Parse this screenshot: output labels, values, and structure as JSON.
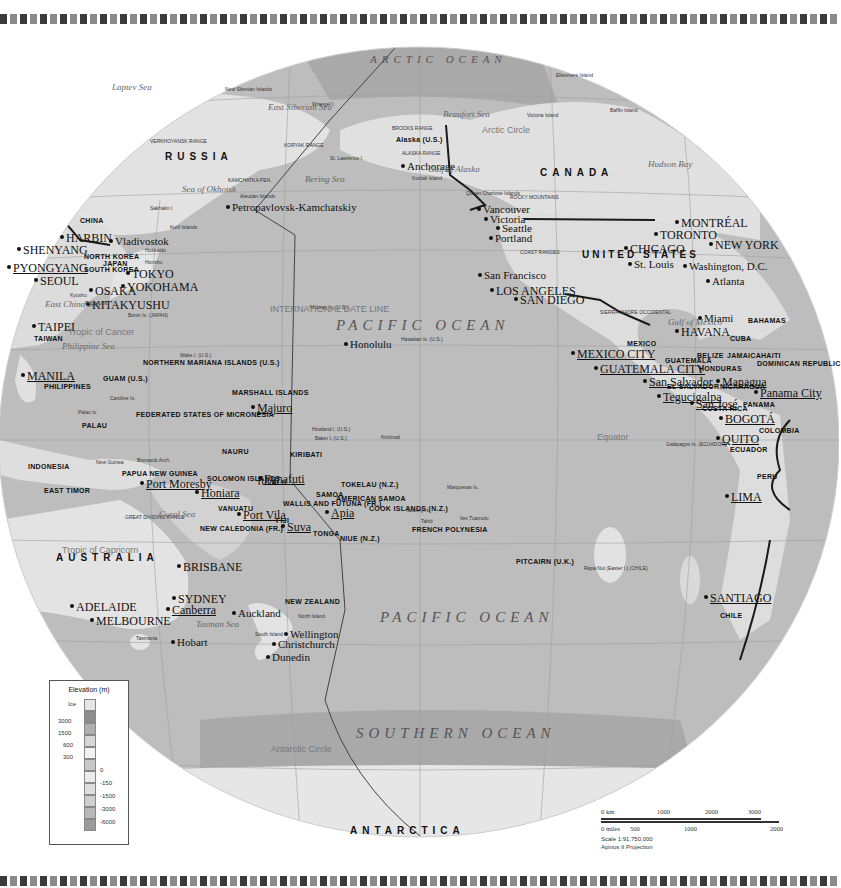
{
  "map": {
    "title": "Pacific Ocean (Azimuthal projection)",
    "oceans": [
      {
        "name": "ARCTIC OCEAN",
        "x": 370,
        "y": 54
      },
      {
        "name": "PACIFIC OCEAN",
        "x": 336,
        "y": 320
      },
      {
        "name": "PACIFIC OCEAN",
        "x": 380,
        "y": 612
      },
      {
        "name": "SOUTHERN OCEAN",
        "x": 356,
        "y": 728
      }
    ],
    "regions": [
      {
        "name": "RUSSIA",
        "x": 165,
        "y": 156
      },
      {
        "name": "CANADA",
        "x": 540,
        "y": 172
      },
      {
        "name": "UNITED STATES",
        "x": 582,
        "y": 254
      },
      {
        "name": "AUSTRALIA",
        "x": 56,
        "y": 557
      },
      {
        "name": "ANTARCTICA",
        "x": 350,
        "y": 830
      }
    ],
    "countries": [
      {
        "name": "CHINA",
        "x": 80,
        "y": 222
      },
      {
        "name": "NORTH KOREA",
        "x": 84,
        "y": 258
      },
      {
        "name": "SOUTH KOREA",
        "x": 84,
        "y": 271
      },
      {
        "name": "JAPAN",
        "x": 103,
        "y": 265
      },
      {
        "name": "TAIWAN",
        "x": 34,
        "y": 340
      },
      {
        "name": "PHILIPPINES",
        "x": 44,
        "y": 388
      },
      {
        "name": "NORTHERN MARIANA ISLANDS (U.S.)",
        "x": 143,
        "y": 364
      },
      {
        "name": "GUAM (U.S.)",
        "x": 103,
        "y": 380
      },
      {
        "name": "PALAU",
        "x": 82,
        "y": 427
      },
      {
        "name": "FEDERATED STATES OF MICRONESIA",
        "x": 136,
        "y": 416
      },
      {
        "name": "MARSHALL ISLANDS",
        "x": 232,
        "y": 394
      },
      {
        "name": "NAURU",
        "x": 222,
        "y": 453
      },
      {
        "name": "KIRIBATI",
        "x": 290,
        "y": 456
      },
      {
        "name": "INDONESIA",
        "x": 28,
        "y": 468
      },
      {
        "name": "EAST TIMOR",
        "x": 44,
        "y": 492
      },
      {
        "name": "PAPUA NEW GUINEA",
        "x": 122,
        "y": 475
      },
      {
        "name": "SOLOMON ISLANDS",
        "x": 207,
        "y": 480
      },
      {
        "name": "TUVALU",
        "x": 257,
        "y": 484
      },
      {
        "name": "VANUATU",
        "x": 218,
        "y": 510
      },
      {
        "name": "NEW CALEDONIA (FR.)",
        "x": 200,
        "y": 530
      },
      {
        "name": "FIJI",
        "x": 276,
        "y": 522
      },
      {
        "name": "WALLIS AND FUTUNA (FR.)",
        "x": 283,
        "y": 505
      },
      {
        "name": "SAMOA",
        "x": 316,
        "y": 496
      },
      {
        "name": "AMERICAN SAMOA",
        "x": 336,
        "y": 500
      },
      {
        "name": "TONGA",
        "x": 313,
        "y": 535
      },
      {
        "name": "NIUE (N.Z.)",
        "x": 340,
        "y": 540
      },
      {
        "name": "TOKELAU (N.Z.)",
        "x": 341,
        "y": 486
      },
      {
        "name": "COOK ISLANDS (N.Z.)",
        "x": 369,
        "y": 510
      },
      {
        "name": "FRENCH POLYNESIA",
        "x": 412,
        "y": 531
      },
      {
        "name": "PITCAIRN (U.K.)",
        "x": 516,
        "y": 563
      },
      {
        "name": "NEW ZEALAND",
        "x": 285,
        "y": 603
      },
      {
        "name": "MEXICO",
        "x": 627,
        "y": 345
      },
      {
        "name": "BELIZE",
        "x": 697,
        "y": 357
      },
      {
        "name": "GUATEMALA",
        "x": 665,
        "y": 362
      },
      {
        "name": "HONDURAS",
        "x": 699,
        "y": 370
      },
      {
        "name": "EL SALVADOR",
        "x": 667,
        "y": 388
      },
      {
        "name": "NICARAGUA",
        "x": 720,
        "y": 388
      },
      {
        "name": "COSTA RICA",
        "x": 702,
        "y": 410
      },
      {
        "name": "PANAMA",
        "x": 743,
        "y": 406
      },
      {
        "name": "JAMAICA",
        "x": 727,
        "y": 357
      },
      {
        "name": "HAITI",
        "x": 761,
        "y": 357
      },
      {
        "name": "DOMINICAN REPUBLIC",
        "x": 757,
        "y": 365
      },
      {
        "name": "BAHAMAS",
        "x": 748,
        "y": 322
      },
      {
        "name": "CUBA",
        "x": 730,
        "y": 340
      },
      {
        "name": "COLOMBIA",
        "x": 759,
        "y": 432
      },
      {
        "name": "ECUADOR",
        "x": 730,
        "y": 451
      },
      {
        "name": "PERU",
        "x": 757,
        "y": 478
      },
      {
        "name": "CHILE",
        "x": 720,
        "y": 617
      },
      {
        "name": "Alaska (U.S.)",
        "x": 396,
        "y": 141
      }
    ],
    "cities": [
      {
        "name": "HARBIN",
        "x": 66,
        "y": 237,
        "style": "bigcity"
      },
      {
        "name": "SHENYANG",
        "x": 23,
        "y": 249,
        "style": "bigcity"
      },
      {
        "name": "Vladivostok",
        "x": 115,
        "y": 241,
        "style": "city"
      },
      {
        "name": "PYONGYANG",
        "x": 13,
        "y": 267,
        "style": "capital"
      },
      {
        "name": "SEOUL",
        "x": 40,
        "y": 280,
        "style": "bigcity"
      },
      {
        "name": "TOKYO",
        "x": 132,
        "y": 273,
        "style": "bigcity"
      },
      {
        "name": "YOKOHAMA",
        "x": 127,
        "y": 286,
        "style": "bigcity"
      },
      {
        "name": "OSAKA",
        "x": 95,
        "y": 290,
        "style": "bigcity"
      },
      {
        "name": "KITAKYUSHU",
        "x": 92,
        "y": 304,
        "style": "bigcity"
      },
      {
        "name": "TAIPEI",
        "x": 38,
        "y": 326,
        "style": "bigcity"
      },
      {
        "name": "MANILA",
        "x": 27,
        "y": 375,
        "style": "capital"
      },
      {
        "name": "Majuro",
        "x": 257,
        "y": 407,
        "style": "capital"
      },
      {
        "name": "Port Moresby",
        "x": 146,
        "y": 483,
        "style": "capital"
      },
      {
        "name": "Honiara",
        "x": 201,
        "y": 492,
        "style": "capital"
      },
      {
        "name": "Funafuti",
        "x": 264,
        "y": 478,
        "style": "capital"
      },
      {
        "name": "Port Vila",
        "x": 243,
        "y": 514,
        "style": "capital"
      },
      {
        "name": "Suva",
        "x": 287,
        "y": 526,
        "style": "capital"
      },
      {
        "name": "Apia",
        "x": 331,
        "y": 512,
        "style": "capital"
      },
      {
        "name": "BRISBANE",
        "x": 183,
        "y": 566,
        "style": "bigcity"
      },
      {
        "name": "SYDNEY",
        "x": 178,
        "y": 598,
        "style": "bigcity"
      },
      {
        "name": "Canberra",
        "x": 172,
        "y": 609,
        "style": "capital"
      },
      {
        "name": "ADELAIDE",
        "x": 76,
        "y": 606,
        "style": "bigcity"
      },
      {
        "name": "MELBOURNE",
        "x": 96,
        "y": 620,
        "style": "bigcity"
      },
      {
        "name": "Hobart",
        "x": 177,
        "y": 642,
        "style": "city"
      },
      {
        "name": "Auckland",
        "x": 238,
        "y": 613,
        "style": "city"
      },
      {
        "name": "Wellington",
        "x": 290,
        "y": 634,
        "style": "city"
      },
      {
        "name": "Christchurch",
        "x": 278,
        "y": 644,
        "style": "city"
      },
      {
        "name": "Dunedin",
        "x": 272,
        "y": 657,
        "style": "city"
      },
      {
        "name": "Petropavlovsk-Kamchatskiy",
        "x": 232,
        "y": 207,
        "style": "city"
      },
      {
        "name": "Anchorage",
        "x": 407,
        "y": 166,
        "style": "city"
      },
      {
        "name": "Vancouver",
        "x": 483,
        "y": 209,
        "style": "city"
      },
      {
        "name": "Victoria",
        "x": 490,
        "y": 219,
        "style": "city"
      },
      {
        "name": "Seattle",
        "x": 502,
        "y": 228,
        "style": "city"
      },
      {
        "name": "Portland",
        "x": 495,
        "y": 238,
        "style": "city"
      },
      {
        "name": "San Francisco",
        "x": 484,
        "y": 275,
        "style": "city"
      },
      {
        "name": "LOS ANGELES",
        "x": 496,
        "y": 290,
        "style": "bigcity"
      },
      {
        "name": "SAN DIEGO",
        "x": 520,
        "y": 299,
        "style": "bigcity"
      },
      {
        "name": "Honolulu",
        "x": 350,
        "y": 344,
        "style": "city"
      },
      {
        "name": "MONTRÉAL",
        "x": 681,
        "y": 222,
        "style": "bigcity"
      },
      {
        "name": "TORONTO",
        "x": 660,
        "y": 234,
        "style": "bigcity"
      },
      {
        "name": "NEW YORK",
        "x": 715,
        "y": 244,
        "style": "bigcity"
      },
      {
        "name": "CHICAGO",
        "x": 630,
        "y": 248,
        "style": "bigcity"
      },
      {
        "name": "St. Louis",
        "x": 634,
        "y": 264,
        "style": "city"
      },
      {
        "name": "Washington, D.C.",
        "x": 689,
        "y": 266,
        "style": "city"
      },
      {
        "name": "Atlanta",
        "x": 712,
        "y": 281,
        "style": "city"
      },
      {
        "name": "Miami",
        "x": 704,
        "y": 318,
        "style": "city"
      },
      {
        "name": "HAVANA",
        "x": 681,
        "y": 331,
        "style": "bigcity"
      },
      {
        "name": "MEXICO CITY",
        "x": 577,
        "y": 353,
        "style": "capital"
      },
      {
        "name": "GUATEMALA CITY",
        "x": 600,
        "y": 368,
        "style": "capital"
      },
      {
        "name": "San Salvador",
        "x": 649,
        "y": 381,
        "style": "capital"
      },
      {
        "name": "Managua",
        "x": 722,
        "y": 381,
        "style": "capital"
      },
      {
        "name": "Tegucigalpa",
        "x": 663,
        "y": 396,
        "style": "capital"
      },
      {
        "name": "San José",
        "x": 696,
        "y": 403,
        "style": "capital"
      },
      {
        "name": "Panama City",
        "x": 760,
        "y": 392,
        "style": "capital"
      },
      {
        "name": "BOGOTÁ",
        "x": 725,
        "y": 418,
        "style": "capital"
      },
      {
        "name": "QUITO",
        "x": 722,
        "y": 438,
        "style": "capital"
      },
      {
        "name": "LIMA",
        "x": 731,
        "y": 496,
        "style": "capital"
      },
      {
        "name": "SANTIAGO",
        "x": 710,
        "y": 597,
        "style": "capital"
      }
    ],
    "seas": [
      {
        "name": "Laptev Sea",
        "x": 112,
        "y": 88
      },
      {
        "name": "East Siberian Sea",
        "x": 268,
        "y": 108
      },
      {
        "name": "Sea of Okhotsk",
        "x": 182,
        "y": 190
      },
      {
        "name": "Bering Sea",
        "x": 305,
        "y": 180
      },
      {
        "name": "Gulf of Alaska",
        "x": 428,
        "y": 170
      },
      {
        "name": "Beaufort Sea",
        "x": 443,
        "y": 115
      },
      {
        "name": "Hudson Bay",
        "x": 648,
        "y": 165
      },
      {
        "name": "East China Sea",
        "x": 45,
        "y": 305
      },
      {
        "name": "Philippine Sea",
        "x": 62,
        "y": 347
      },
      {
        "name": "Coral Sea",
        "x": 159,
        "y": 515
      },
      {
        "name": "Tasman Sea",
        "x": 196,
        "y": 625
      },
      {
        "name": "Gulf of Mexico",
        "x": 668,
        "y": 323
      }
    ],
    "islands": [
      {
        "name": "New Siberian Islands",
        "x": 225,
        "y": 92
      },
      {
        "name": "Wrangel I.",
        "x": 312,
        "y": 107
      },
      {
        "name": "St. Lawrence I.",
        "x": 330,
        "y": 161
      },
      {
        "name": "Kodiak Island",
        "x": 412,
        "y": 181
      },
      {
        "name": "Queen Charlotte Islands",
        "x": 466,
        "y": 196
      },
      {
        "name": "Victoria Island",
        "x": 527,
        "y": 118
      },
      {
        "name": "Ellesmere Island",
        "x": 556,
        "y": 78
      },
      {
        "name": "Baffin Island",
        "x": 610,
        "y": 113
      },
      {
        "name": "Sakhalin I.",
        "x": 150,
        "y": 211
      },
      {
        "name": "Hokkaido",
        "x": 145,
        "y": 253
      },
      {
        "name": "Honshu",
        "x": 145,
        "y": 265
      },
      {
        "name": "Kyushu",
        "x": 70,
        "y": 298
      },
      {
        "name": "Ryukyu Is.",
        "x": 85,
        "y": 306
      },
      {
        "name": "Bonin Is. (JAPAN)",
        "x": 128,
        "y": 318
      },
      {
        "name": "Wake I. (U.S.)",
        "x": 180,
        "y": 358
      },
      {
        "name": "Midway Is. (U.S.)",
        "x": 310,
        "y": 310
      },
      {
        "name": "Hawaiian Is. (U.S.)",
        "x": 401,
        "y": 342
      },
      {
        "name": "Caroline Is.",
        "x": 110,
        "y": 401
      },
      {
        "name": "Palau Is.",
        "x": 78,
        "y": 415
      },
      {
        "name": "Howland I. (U.S.)",
        "x": 312,
        "y": 432
      },
      {
        "name": "Baker I. (U.S.)",
        "x": 315,
        "y": 441
      },
      {
        "name": "Kiritimati",
        "x": 381,
        "y": 440
      },
      {
        "name": "Bismarck Arch.",
        "x": 137,
        "y": 463
      },
      {
        "name": "New Guinea",
        "x": 96,
        "y": 465
      },
      {
        "name": "Marquesas Is.",
        "x": 447,
        "y": 490
      },
      {
        "name": "Society Is.",
        "x": 407,
        "y": 513
      },
      {
        "name": "Tahiti",
        "x": 421,
        "y": 524
      },
      {
        "name": "Iles Tuamotu",
        "x": 460,
        "y": 521
      },
      {
        "name": "Rapa Nui (Easter I.) (CHILE)",
        "x": 584,
        "y": 571
      },
      {
        "name": "Galápagos Is. (ECUADOR)",
        "x": 666,
        "y": 447
      },
      {
        "name": "Tasmania",
        "x": 136,
        "y": 641
      },
      {
        "name": "North Island",
        "x": 298,
        "y": 619
      },
      {
        "name": "South Island",
        "x": 255,
        "y": 637
      },
      {
        "name": "Aleutian Islands",
        "x": 240,
        "y": 199
      },
      {
        "name": "Kuril Islands",
        "x": 170,
        "y": 230
      }
    ],
    "features": [
      {
        "name": "VERKHOYANSK RANGE",
        "x": 150,
        "y": 144
      },
      {
        "name": "KORYAK RANGE",
        "x": 284,
        "y": 148
      },
      {
        "name": "KAMCHATKA PEN.",
        "x": 228,
        "y": 183
      },
      {
        "name": "BROOKS RANGE",
        "x": 392,
        "y": 131
      },
      {
        "name": "ALASKA RANGE",
        "x": 402,
        "y": 156
      },
      {
        "name": "ROCKY MOUNTAINS",
        "x": 510,
        "y": 200
      },
      {
        "name": "SIERRA MADRE OCCIDENTAL",
        "x": 600,
        "y": 315
      },
      {
        "name": "GREAT DIVIDING RANGE",
        "x": 125,
        "y": 520
      },
      {
        "name": "COAST RANGES",
        "x": 520,
        "y": 255
      }
    ],
    "lines": [
      {
        "name": "Arctic Circle",
        "x": 482,
        "y": 131
      },
      {
        "name": "Tropic of Cancer",
        "x": 68,
        "y": 333
      },
      {
        "name": "Equator",
        "x": 597,
        "y": 438
      },
      {
        "name": "Tropic of Capricorn",
        "x": 62,
        "y": 551
      },
      {
        "name": "Antarctic Circle",
        "x": 271,
        "y": 750
      },
      {
        "name": "INTERNATIONAL DATE LINE",
        "x": 270,
        "y": 310
      }
    ],
    "graticule_top": [
      "80°",
      "140°",
      "160°",
      "180°",
      "160°",
      "140°",
      "120°",
      "100°",
      "80°"
    ],
    "graticule_bottom": [
      "80°",
      "140°",
      "160°",
      "180°",
      "160°",
      "140°",
      "120°",
      "100°",
      "80°"
    ],
    "graticule_side": [
      "60°",
      "40°",
      "20°",
      "20°",
      "40°",
      "60°"
    ]
  },
  "legend": {
    "title": "Elevation (m)",
    "land": [
      "Ice",
      "3000",
      "1500",
      "600",
      "300"
    ],
    "sea": [
      "0",
      "-150",
      "-1500",
      "-3000",
      "-6000"
    ],
    "colors": [
      "#e6e6e6",
      "#8d8d8d",
      "#b0b0b0",
      "#d6d6d6",
      "#f2f2f2",
      "#c8c8c8",
      "#ececec",
      "#dedede",
      "#cfcfcf",
      "#b8b8b8",
      "#9c9c9c"
    ]
  },
  "scale": {
    "km_ticks": [
      "0 km",
      "1000",
      "2000",
      "3000"
    ],
    "mile_ticks": [
      "0 miles",
      "500",
      "1000",
      "2000"
    ],
    "ratio": "Scale 1:91,750,000",
    "projection": "Apinus II Projection"
  },
  "colors": {
    "ocean": "#bdbdbd",
    "deep_ocean": "#a8a8a8",
    "shallow": "#d8d8d8",
    "land": "#e4e4e4",
    "border": "#1a1a1a",
    "dateline": "#444444"
  }
}
